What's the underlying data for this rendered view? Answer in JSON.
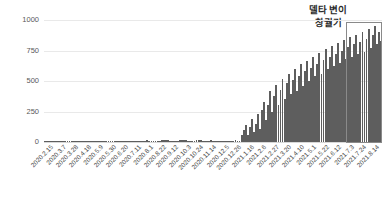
{
  "chart_data": {
    "type": "bar",
    "title": "",
    "subtitle": "",
    "xlabel": "",
    "ylabel": "",
    "ylim": [
      0,
      1000
    ],
    "yticks": [
      0,
      250,
      500,
      750,
      1000
    ],
    "ytick_labels": [
      "0",
      "250",
      "500",
      "750",
      "1000"
    ],
    "grid": true,
    "legend": false,
    "legend_position": "none",
    "bar_color": "#5e5e5e",
    "categories": [
      "2020.2.15",
      "2020.3.7",
      "2020.3.28",
      "2020.4.18",
      "2020.5.9",
      "2020.5.30",
      "2020.6.20",
      "2020.7.11",
      "2020.8.1",
      "2020.8.22",
      "2020.9.12",
      "2020.10.3",
      "2020.10.24",
      "2020.11.14",
      "2020.12.5",
      "2020.12.26",
      "2021.1.16",
      "2021.2.6",
      "2021.2.27",
      "2021.3.20",
      "2021.4.10",
      "2021.5.1",
      "2021.5.22",
      "2021.6.12",
      "2021.7.3",
      "2021.7.24",
      "2021.8.14"
    ],
    "x_tick_labels": [
      "2020.2.15",
      "2020.3.7",
      "2020.3.28",
      "2020.4.18",
      "2020.5.9",
      "2020.5.30",
      "2020.6.20",
      "2020.7.11",
      "2020.8.1",
      "2020.8.22",
      "2020.9.12",
      "2020.10.3",
      "2020.10.24",
      "2020.11.14",
      "2020.12.5",
      "2020.12.26",
      "2021.1.16",
      "2021.2.6",
      "2021.2.27",
      "2021.3.20",
      "2021.4.10",
      "2021.5.1",
      "2021.5.22",
      "2021.6.12",
      "2021.7.3",
      "2021.7.24",
      "2021.8.14"
    ],
    "values": [
      5,
      8,
      6,
      4,
      3,
      5,
      6,
      5,
      4,
      12,
      10,
      6,
      5,
      14,
      18,
      20,
      14,
      10,
      9,
      12,
      14,
      12,
      15,
      18,
      60,
      420,
      760
    ],
    "series": [
      {
        "name": "daily-cases",
        "color": "#5e5e5e",
        "values": [
          5,
          8,
          6,
          4,
          3,
          5,
          6,
          5,
          4,
          12,
          10,
          6,
          5,
          14,
          18,
          20,
          14,
          10,
          9,
          12,
          14,
          12,
          15,
          18,
          60,
          420,
          760
        ]
      }
    ],
    "fine_bars": [
      4,
      6,
      9,
      12,
      8,
      5,
      4,
      6,
      5,
      3,
      4,
      6,
      5,
      4,
      3,
      5,
      4,
      6,
      8,
      5,
      4,
      6,
      7,
      5,
      4,
      3,
      5,
      6,
      4,
      5,
      7,
      6,
      5,
      4,
      6,
      8,
      10,
      7,
      5,
      4,
      6,
      9,
      12,
      10,
      8,
      6,
      5,
      7,
      9,
      12,
      15,
      11,
      9,
      7,
      6,
      8,
      10,
      14,
      18,
      16,
      13,
      10,
      8,
      7,
      9,
      12,
      16,
      20,
      17,
      14,
      11,
      9,
      8,
      10,
      13,
      16,
      14,
      12,
      10,
      9,
      11,
      14,
      12,
      10,
      9,
      8,
      10,
      12,
      11,
      9,
      8,
      10,
      12,
      14,
      11,
      9,
      55,
      95,
      140,
      60,
      120,
      190,
      85,
      150,
      230,
      110,
      260,
      330,
      180,
      300,
      420,
      250,
      380,
      470,
      300,
      430,
      520,
      350,
      480,
      560,
      390,
      510,
      600,
      420,
      545,
      640,
      460,
      580,
      665,
      500,
      610,
      700,
      540,
      640,
      730,
      560,
      670,
      760,
      600,
      700,
      790,
      620,
      725,
      815,
      650,
      750,
      840,
      680,
      775,
      860,
      700,
      800,
      880,
      720,
      820,
      900,
      740,
      845,
      930,
      770,
      880,
      955,
      800,
      900,
      830
    ],
    "highlight_region": {
      "label_line1": "델타 변이",
      "label_line2": "창궐기",
      "start_category": "2021.7.3",
      "end_category": "2021.8.14",
      "border_color": "#8a8a8a"
    },
    "annotation_text": "델타 변이 창궐기"
  }
}
